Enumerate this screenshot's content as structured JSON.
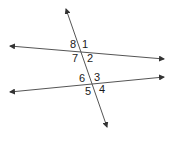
{
  "diagram": {
    "type": "parallel-lines-transversal",
    "line_color": "#555555",
    "label_color": "#1a1a1a",
    "lines": [
      {
        "name": "upper-line",
        "x1": 10,
        "y1": 46,
        "x2": 164,
        "y2": 59
      },
      {
        "name": "lower-line",
        "x1": 10,
        "y1": 92,
        "x2": 164,
        "y2": 77
      },
      {
        "name": "transversal",
        "x1": 66,
        "y1": 9,
        "x2": 107,
        "y2": 127
      }
    ],
    "angles": [
      {
        "label": "1",
        "x": 82,
        "y": 48
      },
      {
        "label": "2",
        "x": 87,
        "y": 62
      },
      {
        "label": "3",
        "x": 94,
        "y": 81
      },
      {
        "label": "4",
        "x": 99,
        "y": 93
      },
      {
        "label": "5",
        "x": 85,
        "y": 95
      },
      {
        "label": "6",
        "x": 79,
        "y": 82
      },
      {
        "label": "7",
        "x": 72,
        "y": 62
      },
      {
        "label": "8",
        "x": 70,
        "y": 48
      }
    ]
  }
}
